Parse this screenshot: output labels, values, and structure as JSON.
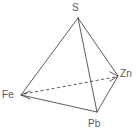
{
  "figure": {
    "name": "quaternary-tetrahedron-diagram",
    "background_color": "#ffffff",
    "line_color": "#4a4a4a",
    "label_color": "#5a5a5a",
    "width": 139,
    "height": 134
  },
  "vertices": {
    "top": {
      "label": "S",
      "x": 78,
      "y": 18
    },
    "left": {
      "label": "Fe",
      "x": 21,
      "y": 95
    },
    "right": {
      "label": "Zn",
      "x": 118,
      "y": 76
    },
    "bottom": {
      "label": "Pb",
      "x": 97,
      "y": 112
    }
  },
  "edges": [
    {
      "name": "s-fe",
      "from": "S",
      "to": "Fe",
      "style": "solid"
    },
    {
      "name": "s-zn",
      "from": "S",
      "to": "Zn",
      "style": "solid"
    },
    {
      "name": "s-pb",
      "from": "S",
      "to": "Pb",
      "style": "solid"
    },
    {
      "name": "fe-pb",
      "from": "Fe",
      "to": "Pb",
      "style": "solid"
    },
    {
      "name": "zn-pb",
      "from": "Zn",
      "to": "Pb",
      "style": "solid"
    },
    {
      "name": "fe-zn",
      "from": "Fe",
      "to": "Zn",
      "style": "dashed"
    }
  ],
  "arrowheads": [
    {
      "name": "arrow-at-fe",
      "at": "Fe"
    },
    {
      "name": "arrow-at-zn",
      "at": "Zn"
    }
  ]
}
